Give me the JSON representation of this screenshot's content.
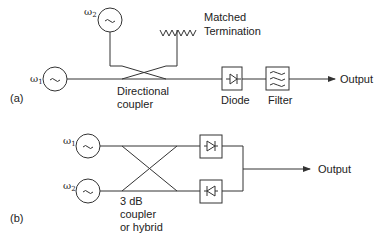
{
  "panel_a": {
    "label": "(a)",
    "source1": {
      "symbol": "ω",
      "sub": "1"
    },
    "source2": {
      "symbol": "ω",
      "sub": "2"
    },
    "termination": {
      "line1": "Matched",
      "line2": "Termination"
    },
    "coupler": {
      "line1": "Directional",
      "line2": "coupler"
    },
    "diode": "Diode",
    "filter": "Filter",
    "output": "Output"
  },
  "panel_b": {
    "label": "(b)",
    "source1": {
      "symbol": "ω",
      "sub": "1"
    },
    "source2": {
      "symbol": "ω",
      "sub": "2"
    },
    "hybrid": {
      "line1": "3 dB",
      "line2": "coupler",
      "line3": "or hybrid"
    },
    "output": "Output"
  },
  "colors": {
    "line": "#333333",
    "text": "#222222"
  }
}
